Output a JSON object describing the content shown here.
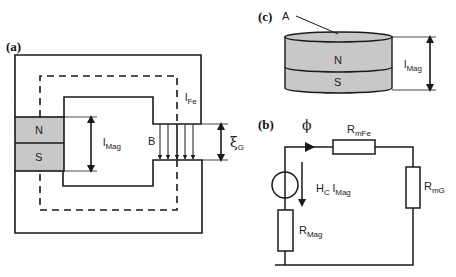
{
  "panels": {
    "a": {
      "label": "(a)",
      "magnet_north": "N",
      "magnet_south": "S",
      "length_label": "l",
      "length_sub": "Mag",
      "iron_label": "l",
      "iron_sub": "Fe",
      "flux_density_label": "B",
      "gap_label": "ξ",
      "gap_sub": "G"
    },
    "b": {
      "label": "(b)",
      "flux_symbol": "ϕ",
      "r_fe_label": "R",
      "r_fe_sub": "mFe",
      "r_gap_label": "R",
      "r_gap_sub": "mG",
      "source_label_h": "H",
      "source_label_h_sub": "C",
      "source_label_l": " l",
      "source_label_l_sub": "Mag",
      "r_mag_label": "R",
      "r_mag_sub": "Mag"
    },
    "c": {
      "label": "(c)",
      "area_label": "A",
      "magnet_north": "N",
      "magnet_south": "S",
      "length_label": "l",
      "length_sub": "Mag"
    }
  },
  "colors": {
    "line": "#1a1a1a",
    "magnet_fill": "#c8c8c8"
  }
}
